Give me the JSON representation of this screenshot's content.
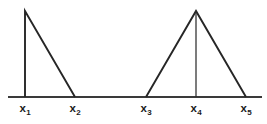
{
  "figure": {
    "background_color": "#ffffff",
    "line_color": "#262626",
    "axis_color": "#3a3a3a",
    "label_color": "#1b1b1b",
    "width": 267,
    "height": 124
  },
  "axis": {
    "name": "horizontal-baseline",
    "x_start": 8,
    "x_end": 262,
    "y": 97
  },
  "labels": [
    {
      "id": "x1",
      "base": "x",
      "subscript": "1",
      "x": 25,
      "y": 103
    },
    {
      "id": "x2",
      "base": "x",
      "subscript": "2",
      "x": 75,
      "y": 103
    },
    {
      "id": "x3",
      "base": "x",
      "subscript": "3",
      "x": 146,
      "y": 103
    },
    {
      "id": "x4",
      "base": "x",
      "subscript": "4",
      "x": 196,
      "y": 103
    },
    {
      "id": "x5",
      "base": "x",
      "subscript": "5",
      "x": 246,
      "y": 103
    }
  ],
  "chart_data": {
    "type": "line",
    "title": "",
    "xlabel": "",
    "ylabel": "",
    "grid": false,
    "legend": false,
    "xlim": [
      8,
      262
    ],
    "ylim": [
      97,
      11
    ],
    "x_tick_positions": [
      25,
      75,
      146,
      196,
      246
    ],
    "x_tick_labels": [
      "x1",
      "x2",
      "x3",
      "x4",
      "x5"
    ],
    "annotations": [],
    "series": [
      {
        "name": "right-triangle-left",
        "shape": "right-triangle",
        "description": "Vertical rising edge at x1, linear falling edge from x1 to x2",
        "points": [
          {
            "x": 25,
            "y": 97
          },
          {
            "x": 25,
            "y": 11
          },
          {
            "x": 75,
            "y": 97
          }
        ],
        "peak_x": 25,
        "peak_y": 11,
        "left_foot_x": 25,
        "right_foot_x": 75
      },
      {
        "name": "isosceles-triangle-right",
        "shape": "isosceles-triangle",
        "description": "Linear rising edge from x3 to x4, linear falling edge from x4 to x5",
        "points": [
          {
            "x": 146,
            "y": 97
          },
          {
            "x": 196,
            "y": 11
          },
          {
            "x": 246,
            "y": 97
          }
        ],
        "peak_x": 196,
        "peak_y": 11,
        "left_foot_x": 146,
        "right_foot_x": 246
      },
      {
        "name": "apex-median",
        "shape": "vertical-segment",
        "description": "Vertical line from apex of second triangle down to baseline at x4",
        "points": [
          {
            "x": 196,
            "y": 11
          },
          {
            "x": 196,
            "y": 97
          }
        ]
      }
    ]
  }
}
